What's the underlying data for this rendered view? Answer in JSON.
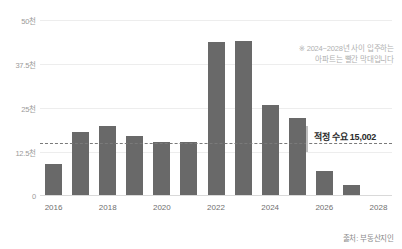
{
  "chart_data": {
    "type": "bar",
    "title": "",
    "xlabel": "",
    "ylabel": "",
    "categories": [
      "2016",
      "2017",
      "2018",
      "2019",
      "2020",
      "2021",
      "2022",
      "2023",
      "2024",
      "2025",
      "2026",
      "2027",
      "2028"
    ],
    "values": [
      8800,
      18000,
      19700,
      16800,
      15100,
      15100,
      43500,
      43800,
      25600,
      21900,
      6800,
      2800,
      0
    ],
    "x_tick_labels": [
      "2016",
      "2018",
      "2020",
      "2022",
      "2024",
      "2026",
      "2028"
    ],
    "y_tick_labels": [
      "50천",
      "37.5천",
      "25천",
      "12.5천",
      "0"
    ],
    "y_tick_values": [
      50000,
      37500,
      25000,
      12500,
      0
    ],
    "ylim": [
      0,
      50000
    ],
    "grid": true,
    "legend_position": "none",
    "bar_color": "#696969",
    "grid_color": "#ededed",
    "threshold": {
      "value": 15002,
      "label": "적정 수요 15,002",
      "line_style": "dashed",
      "line_color": "#7a7a7a"
    },
    "annotations": [
      "※ 2024~2028년 사이 입주하는",
      "아파트는 빨간 막대입니다"
    ],
    "source": "출처: 부동산지인"
  }
}
